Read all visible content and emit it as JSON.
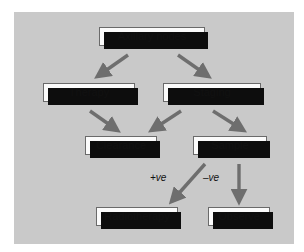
{
  "figure": {
    "kind": "clinical-decision-flowchart",
    "background_color": "#ffffff",
    "panel_color": "#c9c9c9",
    "node_fill_color": "#fbfbfb",
    "node_border_color": "#6a6a6a",
    "node_shadow_color": "#0d0d0d",
    "arrow_color": "#6e6e6e",
    "text_color": "#111111"
  },
  "nodes": {
    "axillary": "Axillary nodes",
    "therapy": "Therapy",
    "staging": "Staging",
    "clearance": "Clearance",
    "sample": "Sample",
    "radiotherapy": "Radiotherapy",
    "observe": "Observe"
  },
  "edge_labels": {
    "positive": "+ve",
    "negative": "–ve"
  },
  "edges": [
    {
      "from": "axillary",
      "to": "therapy",
      "label": ""
    },
    {
      "from": "axillary",
      "to": "staging",
      "label": ""
    },
    {
      "from": "therapy",
      "to": "clearance",
      "label": ""
    },
    {
      "from": "staging",
      "to": "clearance",
      "label": ""
    },
    {
      "from": "staging",
      "to": "sample",
      "label": ""
    },
    {
      "from": "sample",
      "to": "radiotherapy",
      "label": "+ve"
    },
    {
      "from": "sample",
      "to": "observe",
      "label": "–ve"
    }
  ]
}
